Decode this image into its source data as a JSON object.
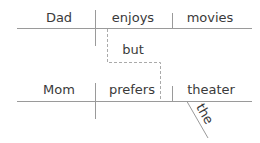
{
  "diagram": {
    "type": "sentence-diagram",
    "clause1": {
      "subject": "Dad",
      "verb": "enjoys",
      "object": "movies"
    },
    "conjunction": "but",
    "clause2": {
      "subject": "Mom",
      "verb": "prefers",
      "object": "theater",
      "modifier": "the"
    }
  },
  "colors": {
    "text": "#3a3a3a",
    "line": "#9a9a9a",
    "dashed": "#aaaaaa"
  }
}
